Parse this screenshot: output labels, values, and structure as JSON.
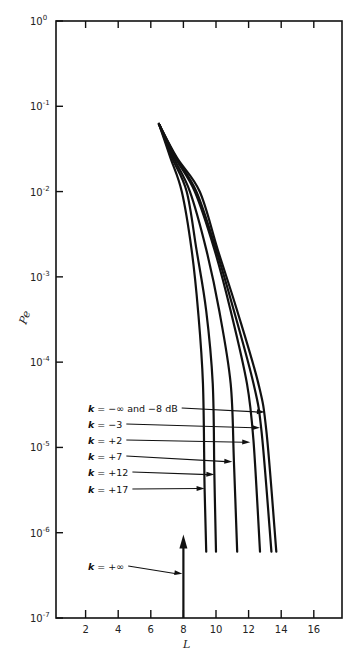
{
  "chart_data": {
    "type": "line",
    "title": "",
    "xlabel": "L",
    "ylabel": "Pe",
    "xscale": "linear",
    "yscale": "log",
    "xlim": [
      0,
      17.5
    ],
    "ylim": [
      1e-07,
      1
    ],
    "grid": false,
    "x_ticks": [
      2,
      4,
      6,
      8,
      10,
      12,
      14,
      16
    ],
    "x_tick_labels": [
      "2",
      "4",
      "6",
      "8",
      "10",
      "12",
      "14",
      "16"
    ],
    "y_ticks": [
      1,
      0.1,
      0.01,
      0.001,
      0.0001,
      1e-05,
      1e-06,
      1e-07
    ],
    "y_tick_labels": [
      {
        "base": "10",
        "exp": "0"
      },
      {
        "base": "10",
        "exp": "-1"
      },
      {
        "base": "10",
        "exp": "-2"
      },
      {
        "base": "10",
        "exp": "-3"
      },
      {
        "base": "10",
        "exp": "-4"
      },
      {
        "base": "10",
        "exp": "-5"
      },
      {
        "base": "10",
        "exp": "-6"
      },
      {
        "base": "10",
        "exp": "-7"
      }
    ],
    "series": [
      {
        "name": "k = -∞ and -8 dB",
        "label_k": "k",
        "label_rest": " = −∞ and −8 dB",
        "points": [
          [
            6.5,
            0.062
          ],
          [
            7.6,
            0.025
          ],
          [
            9.0,
            0.01
          ],
          [
            10.1,
            0.0021
          ],
          [
            11.3,
            0.0004
          ],
          [
            12.6,
            5.6e-05
          ],
          [
            13.1,
            1.5e-05
          ],
          [
            13.7,
            6e-07
          ]
        ],
        "arrow_at": [
          13.0,
          2.6e-05
        ]
      },
      {
        "name": "k = -3",
        "label_k": "k",
        "label_rest": " = −3",
        "points": [
          [
            6.5,
            0.062
          ],
          [
            7.55,
            0.025
          ],
          [
            8.8,
            0.01
          ],
          [
            10.0,
            0.0021
          ],
          [
            11.1,
            0.0004
          ],
          [
            12.3,
            5.6e-05
          ],
          [
            12.8,
            1.5e-05
          ],
          [
            13.4,
            6e-07
          ]
        ],
        "arrow_at": [
          12.7,
          1.7e-05
        ]
      },
      {
        "name": "k = +2",
        "label_k": "k",
        "label_rest": " = +2",
        "points": [
          [
            6.5,
            0.062
          ],
          [
            7.5,
            0.025
          ],
          [
            8.7,
            0.01
          ],
          [
            9.9,
            0.0021
          ],
          [
            10.9,
            0.0004
          ],
          [
            11.9,
            5.6e-05
          ],
          [
            12.3,
            1.2e-05
          ],
          [
            12.7,
            6e-07
          ]
        ],
        "arrow_at": [
          12.1,
          1.15e-05
        ]
      },
      {
        "name": "k = +7",
        "label_k": "k",
        "label_rest": " = +7",
        "points": [
          [
            6.5,
            0.062
          ],
          [
            7.4,
            0.025
          ],
          [
            8.4,
            0.01
          ],
          [
            9.4,
            0.0021
          ],
          [
            10.2,
            0.0004
          ],
          [
            10.9,
            5.6e-05
          ],
          [
            11.1,
            6.8e-06
          ],
          [
            11.3,
            6e-07
          ]
        ],
        "arrow_at": [
          11.0,
          6.8e-06
        ]
      },
      {
        "name": "k = +12",
        "label_k": "k",
        "label_rest": " = +12",
        "points": [
          [
            6.5,
            0.062
          ],
          [
            7.3,
            0.025
          ],
          [
            8.2,
            0.01
          ],
          [
            8.8,
            0.0021
          ],
          [
            9.4,
            0.0004
          ],
          [
            9.8,
            5.6e-05
          ],
          [
            9.9,
            4.8e-06
          ],
          [
            10.0,
            6e-07
          ]
        ],
        "arrow_at": [
          9.9,
          4.8e-06
        ]
      },
      {
        "name": "k = +17",
        "label_k": "k",
        "label_rest": " = +17",
        "points": [
          [
            6.5,
            0.062
          ],
          [
            7.2,
            0.025
          ],
          [
            7.9,
            0.01
          ],
          [
            8.5,
            0.0021
          ],
          [
            8.9,
            0.0004
          ],
          [
            9.2,
            5.6e-05
          ],
          [
            9.3,
            3.3e-06
          ],
          [
            9.4,
            6e-07
          ]
        ],
        "arrow_at": [
          9.3,
          3.3e-06
        ]
      }
    ],
    "annotations": [
      {
        "text_k": "k",
        "text_rest": " = +∞",
        "target": "vertical arrow at L = 8",
        "arrow_at": [
          8.0,
          3.3e-07
        ]
      }
    ],
    "vertical_arrow": {
      "x": 8,
      "from": 1e-07,
      "to": 9e-07,
      "label": "k = +∞"
    }
  }
}
